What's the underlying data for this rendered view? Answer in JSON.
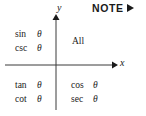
{
  "figure": {
    "background_color": "#ffffff",
    "ink_color": "#1a1a1a",
    "width": 146,
    "height": 116
  },
  "note": {
    "label": "NOTE",
    "arrow_icon": "triangle-right-icon"
  },
  "axes": {
    "y_label": "y",
    "x_label": "x",
    "origin_x": 56,
    "origin_y": 65,
    "y_arrow_icon": "arrow-up-icon",
    "x_arrow_icon": "arrow-right-icon"
  },
  "quadrants": [
    {
      "id": "quadrant-1",
      "name": "All",
      "entries": [
        {
          "func": "All",
          "variable": ""
        }
      ]
    },
    {
      "id": "quadrant-2",
      "name": "Sine",
      "entries": [
        {
          "func": "sin",
          "variable": "θ"
        },
        {
          "func": "csc",
          "variable": "θ"
        }
      ]
    },
    {
      "id": "quadrant-3",
      "name": "Tangent",
      "entries": [
        {
          "func": "tan",
          "variable": "θ"
        },
        {
          "func": "cot",
          "variable": "θ"
        }
      ]
    },
    {
      "id": "quadrant-4",
      "name": "Cosine",
      "entries": [
        {
          "func": "cos",
          "variable": "θ"
        },
        {
          "func": "sec",
          "variable": "θ"
        }
      ]
    }
  ]
}
